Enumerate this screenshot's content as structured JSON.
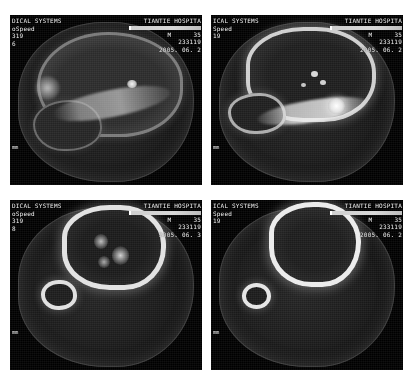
{
  "page": {
    "background_color": "#ffffff",
    "panel_background": "#000000",
    "overlay_text_color": "#f2f2f2"
  },
  "panels": [
    {
      "position": "top-left",
      "manufacturer_line": "DICAL SYSTEMS",
      "scanner_line": "oSpeed",
      "id_line": "319",
      "extra_line": "6",
      "hospital": "TIANTIE HOSPITA",
      "sex_label": "M",
      "age": "35",
      "accession": "233119",
      "date": "2005. 06. 2",
      "scale_label": "mm"
    },
    {
      "position": "top-right",
      "manufacturer_line": "ICAL SYSTEMS",
      "scanner_line": "Speed",
      "id_line": "19",
      "extra_line": "",
      "hospital": "TIANTIE HOSPITA",
      "sex_label": "M",
      "age": "35",
      "accession": "233119",
      "date": "2005. 06. 2",
      "scale_label": "mm"
    },
    {
      "position": "bottom-left",
      "manufacturer_line": "DICAL SYSTEMS",
      "scanner_line": "oSpeed",
      "id_line": "319",
      "extra_line": "8",
      "hospital": "TIANTIE HOSPITA",
      "sex_label": "M",
      "age": "35",
      "accession": "233119",
      "date": "2005. 06. 3",
      "scale_label": "mm"
    },
    {
      "position": "bottom-right",
      "manufacturer_line": "ICAL SYSTEMS",
      "scanner_line": "Speed",
      "id_line": "19",
      "extra_line": "",
      "hospital": "TIANTIE HOSPITA",
      "sex_label": "M",
      "age": "35",
      "accession": "233119",
      "date": "2005. 06. 2",
      "scale_label": "mm"
    }
  ]
}
